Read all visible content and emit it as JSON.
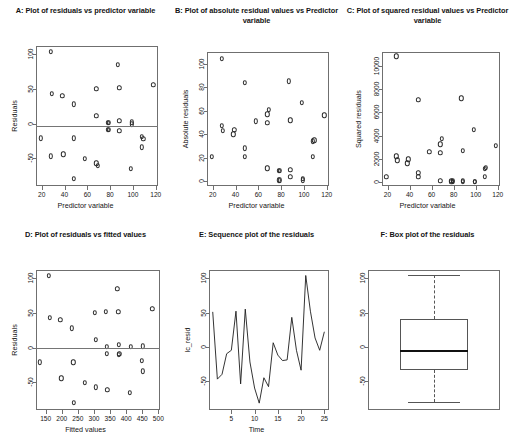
{
  "figure": {
    "panel_count": 6
  },
  "chart_data": [
    {
      "id": "A",
      "type": "scatter",
      "title": "A: Plot of residuals vs predictor variable",
      "xlabel": "Predictor variable",
      "ylabel": "Residuals",
      "xlim": [
        15,
        122
      ],
      "ylim": [
        -90,
        112
      ],
      "xticks": [
        20,
        40,
        60,
        80,
        100,
        120
      ],
      "yticks": [
        -50,
        0,
        50,
        100
      ],
      "grid": false,
      "point_symbol": "o",
      "reference_line_y": -4,
      "x": [
        19,
        28,
        28,
        29,
        38,
        39,
        48,
        48,
        48,
        58,
        68,
        68,
        68,
        69,
        78,
        78,
        79,
        79,
        87,
        88,
        88,
        88,
        98,
        99,
        99,
        108,
        108,
        109,
        118
      ],
      "y": [
        -21,
        104,
        -47,
        43,
        40,
        -44,
        28,
        -21,
        -80,
        -51,
        50,
        11,
        -57,
        -61,
        1,
        -9,
        1,
        -9,
        85,
        52,
        4,
        -10,
        -65,
        -1,
        2,
        -19,
        -34,
        -22,
        56
      ]
    },
    {
      "id": "B",
      "type": "scatter",
      "title": "B: Plot of absolute residual values vs Predictor variable",
      "xlabel": "Predictor variable",
      "ylabel": "Absolute residuals",
      "xlim": [
        15,
        122
      ],
      "ylim": [
        -4,
        110
      ],
      "xticks": [
        20,
        40,
        60,
        80,
        100,
        120
      ],
      "yticks": [
        0,
        20,
        40,
        60,
        80,
        100
      ],
      "grid": false,
      "point_symbol": "o",
      "x": [
        19,
        28,
        28,
        29,
        38,
        39,
        48,
        48,
        48,
        58,
        68,
        68,
        68,
        69,
        78,
        78,
        79,
        79,
        87,
        88,
        88,
        88,
        98,
        99,
        99,
        108,
        108,
        109,
        118
      ],
      "y": [
        21,
        104,
        47,
        43,
        40,
        44,
        28,
        21,
        84,
        51,
        50,
        11,
        57,
        61,
        1,
        9,
        1,
        9,
        85,
        52,
        4,
        10,
        67,
        1,
        2,
        21,
        34,
        35,
        56
      ]
    },
    {
      "id": "C",
      "type": "scatter",
      "title": "C: Plot of squared residual values vs Predictor variable",
      "xlabel": "Predictor variable",
      "ylabel": "Squared residuals",
      "xlim": [
        15,
        122
      ],
      "ylim": [
        -350,
        11200
      ],
      "xticks": [
        20,
        40,
        60,
        80,
        100,
        120
      ],
      "yticks": [
        0,
        2000,
        4000,
        6000,
        8000,
        10000
      ],
      "grid": false,
      "point_symbol": "o",
      "x": [
        19,
        28,
        28,
        29,
        38,
        39,
        48,
        48,
        48,
        58,
        68,
        68,
        68,
        69,
        78,
        78,
        79,
        79,
        87,
        88,
        88,
        88,
        98,
        99,
        99,
        108,
        108,
        109,
        118
      ],
      "y": [
        441,
        10816,
        2209,
        1849,
        1600,
        1936,
        784,
        441,
        7056,
        2601,
        2500,
        121,
        3249,
        3721,
        1,
        81,
        1,
        81,
        7225,
        2704,
        16,
        100,
        4489,
        1,
        4,
        441,
        1156,
        1225,
        3136
      ]
    },
    {
      "id": "D",
      "type": "scatter",
      "title": "D: Plot of residuals vs fitted values",
      "xlabel": "Fitted values",
      "ylabel": "Residuals",
      "xlim": [
        120,
        505
      ],
      "ylim": [
        -90,
        112
      ],
      "xticks": [
        150,
        200,
        250,
        300,
        350,
        400,
        450,
        500
      ],
      "yticks": [
        -50,
        0,
        50,
        100
      ],
      "grid": false,
      "point_symbol": "o",
      "reference_line_y": 0,
      "x": [
        131,
        160,
        162,
        196,
        199,
        232,
        236,
        237,
        272,
        302,
        305,
        306,
        337,
        339,
        340,
        341,
        373,
        376,
        377,
        378,
        379,
        412,
        414,
        449,
        451,
        452,
        481
      ],
      "y": [
        -21,
        104,
        43,
        40,
        -44,
        28,
        -21,
        -80,
        -51,
        50,
        11,
        -57,
        52,
        1,
        -9,
        -61,
        85,
        52,
        4,
        -10,
        -9,
        -65,
        1,
        -19,
        -34,
        2,
        56
      ]
    },
    {
      "id": "E",
      "type": "line",
      "title": "E: Sequence plot of the residuals",
      "xlabel": "Time",
      "ylabel": "lc_resid",
      "xlim": [
        0.2,
        26
      ],
      "ylim": [
        -92,
        112
      ],
      "xticks": [
        5,
        10,
        15,
        20,
        25
      ],
      "yticks": [
        -50,
        0,
        50,
        100
      ],
      "grid": false,
      "x": [
        1,
        2,
        3,
        4,
        5,
        6,
        7,
        8,
        9,
        10,
        11,
        12,
        13,
        14,
        15,
        16,
        17,
        18,
        19,
        20,
        21,
        22,
        23,
        24,
        25
      ],
      "y": [
        51,
        -47,
        -40,
        -10,
        -5,
        52,
        -54,
        55,
        -22,
        -60,
        -82,
        -45,
        -58,
        6,
        -12,
        -20,
        -19,
        43,
        -5,
        -34,
        104,
        52,
        13,
        -5,
        22
      ]
    },
    {
      "id": "F",
      "type": "boxplot",
      "title": "F: Box plot of the residuals",
      "xlabel": "",
      "ylabel": "",
      "ylim": [
        -92,
        112
      ],
      "yticks": [
        -50,
        0,
        50,
        100
      ],
      "grid": false,
      "whisker_low": -80,
      "q1": -34,
      "median": -6,
      "q3": 41,
      "whisker_high": 104,
      "outliers": []
    }
  ]
}
